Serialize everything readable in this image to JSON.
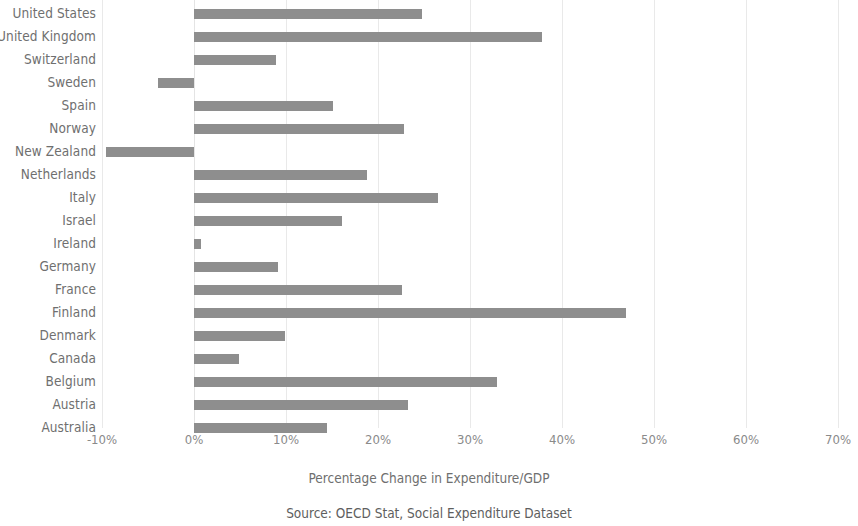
{
  "chart_data": {
    "type": "bar",
    "orientation": "horizontal",
    "title": "",
    "xlabel": "Percentage Change in Expenditure/GDP",
    "ylabel": "",
    "source": "Source: OECD Stat, Social Expenditure Dataset",
    "xlim": [
      -10,
      70
    ],
    "xticks": [
      -10,
      0,
      10,
      20,
      30,
      40,
      50,
      60,
      70
    ],
    "xtick_labels": [
      "-10%",
      "0%",
      "10%",
      "20%",
      "30%",
      "40%",
      "50%",
      "60%",
      "70%"
    ],
    "grid": true,
    "grid_axis": "x",
    "legend": false,
    "bar_color": "#8e8e8e",
    "grid_color": "#e9e9e9",
    "label_color": "#6f6f6f",
    "tick_color": "#8a8a8a",
    "categories": [
      "United States",
      "United Kingdom",
      "Switzerland",
      "Sweden",
      "Spain",
      "Norway",
      "New Zealand",
      "Netherlands",
      "Italy",
      "Israel",
      "Ireland",
      "Germany",
      "France",
      "Finland",
      "Denmark",
      "Canada",
      "Belgium",
      "Austria",
      "Australia"
    ],
    "values": [
      24.8,
      37.8,
      8.9,
      -3.9,
      15.1,
      22.8,
      -9.6,
      18.8,
      26.5,
      16.1,
      0.8,
      9.1,
      22.6,
      47.0,
      9.9,
      4.9,
      32.9,
      23.3,
      14.5
    ],
    "units": "percent"
  }
}
